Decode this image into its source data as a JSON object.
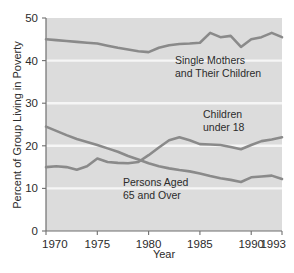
{
  "chart_data": {
    "type": "line",
    "title": "",
    "xlabel": "Year",
    "ylabel": "Percent of Group Living in Poverty",
    "xlim": [
      1970,
      1993
    ],
    "ylim": [
      0,
      50
    ],
    "grid": true,
    "legend": "inline-annotations",
    "xticks": [
      "1970",
      "1975",
      "1980",
      "1985",
      "1990",
      "1993"
    ],
    "xtick_values": [
      1970,
      1975,
      1980,
      1985,
      1990,
      1993
    ],
    "yticks": [
      "0",
      "10",
      "20",
      "30",
      "40",
      "50"
    ],
    "ytick_values": [
      0,
      10,
      20,
      30,
      40,
      50
    ],
    "x": [
      1970,
      1971,
      1972,
      1973,
      1974,
      1975,
      1976,
      1977,
      1978,
      1979,
      1980,
      1981,
      1982,
      1983,
      1984,
      1985,
      1986,
      1987,
      1988,
      1989,
      1990,
      1991,
      1992,
      1993
    ],
    "series": [
      {
        "name": "Single Mothers and Their Children",
        "label_line1": "Single Mothers",
        "label_line2": "and Their Children",
        "color": "#8a8a8a",
        "values": [
          45.0,
          44.8,
          44.6,
          44.4,
          44.2,
          44.0,
          43.5,
          43.0,
          42.6,
          42.2,
          42.0,
          43.0,
          43.6,
          43.9,
          44.0,
          44.2,
          46.5,
          45.5,
          45.8,
          43.2,
          45.0,
          45.5,
          46.5,
          45.5
        ]
      },
      {
        "name": "Children under 18",
        "label_line1": "Children",
        "label_line2": "under 18",
        "color": "#8a8a8a",
        "values": [
          15.0,
          15.2,
          15.0,
          14.4,
          15.2,
          17.0,
          16.2,
          16.0,
          15.9,
          16.2,
          17.8,
          19.6,
          21.3,
          22.0,
          21.3,
          20.4,
          20.3,
          20.2,
          19.7,
          19.2,
          20.2,
          21.1,
          21.5,
          22.0
        ]
      },
      {
        "name": "Persons Aged 65 and Over",
        "label_line1": "Persons Aged",
        "label_line2": "65 and Over",
        "color": "#8a8a8a",
        "values": [
          24.5,
          23.5,
          22.5,
          21.6,
          20.9,
          20.2,
          19.4,
          18.6,
          17.6,
          16.8,
          15.9,
          15.2,
          14.7,
          14.3,
          14.0,
          13.5,
          12.9,
          12.4,
          12.0,
          11.5,
          12.6,
          12.8,
          13.0,
          12.2
        ]
      }
    ]
  },
  "axes": {
    "ylabel": "Percent of Group Living in Poverty",
    "xlabel": "Year"
  },
  "ticks": {
    "y": [
      "50",
      "40",
      "30",
      "20",
      "10",
      "0"
    ],
    "x": [
      "1970",
      "1975",
      "1980",
      "1985",
      "1990",
      "1993"
    ]
  },
  "annotations": {
    "single_mothers_l1": "Single Mothers",
    "single_mothers_l2": "and Their Children",
    "children_l1": "Children",
    "children_l2": "under 18",
    "elderly_l1": "Persons Aged",
    "elderly_l2": "65 and Over"
  },
  "colors": {
    "plot_background": "#dcdcdc",
    "line": "#8a8a8a",
    "gridline": "#f4f4f4",
    "axis": "#6f6f6f",
    "text": "#2b2b2b",
    "page_background": "#ffffff"
  }
}
